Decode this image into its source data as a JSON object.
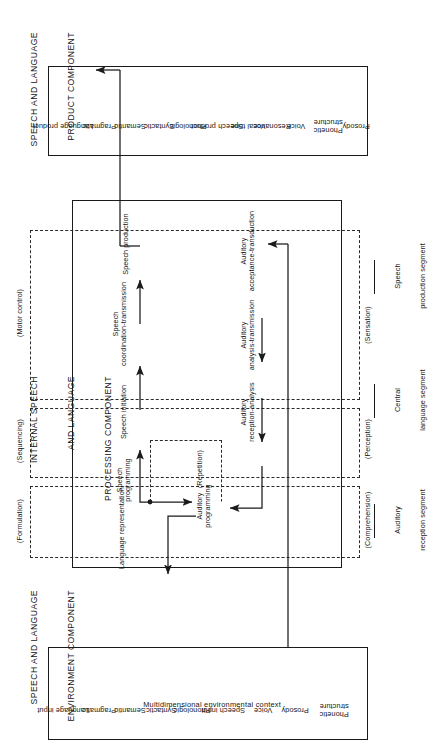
{
  "figure": {
    "orientation": "rotated-90-ccw",
    "ink_color": "#1a1a1a",
    "background": "#ffffff"
  },
  "sections": {
    "product": {
      "heading_line1": "SPEECH AND LANGUAGE",
      "heading_line2": "PRODUCT COMPONENT"
    },
    "internal": {
      "heading_line1": "INTERNAL SPEECH",
      "heading_line2": "AND LANGUAGE",
      "heading_line3": "PROCESSING COMPONENT"
    },
    "environment": {
      "heading_line1": "SPEECH AND LANGUAGE",
      "heading_line2": "ENVIRONMENT COMPONENT"
    }
  },
  "product_box": {
    "items": [
      "Language product",
      "Pragmatic",
      "Semantic",
      "Syntactic",
      "Phonologic",
      "Speech product",
      "Vocal tone",
      "Resonance",
      "Voice",
      "Phonetic\nstructure",
      "Prosody"
    ]
  },
  "environment_box": {
    "items": [
      "Language input",
      "Pragmatic",
      "Semantic",
      "Syntactic",
      "Phonologic",
      "Speech input",
      "Voice",
      "Prosody",
      "Phonetic\nstructure"
    ],
    "context_label": "Multidimensional environmental context"
  },
  "processing": {
    "stage_labels": [
      "(Comprehension)",
      "(Formulation)",
      "(Perception)",
      "(Sequencing)",
      "(Sensation)",
      "(Motor control)",
      "(Repetition)"
    ],
    "nodes": [
      "Language representation",
      "Auditory\nprogramming",
      "Speech\nprogramming",
      "Auditory\nreception-analysis",
      "Speech initiation",
      "Auditory\nanalysis-transmission",
      "Speech\ncoordination-transmission",
      "Auditory\nacceptance-transduction",
      "Speech production"
    ]
  },
  "segments": [
    {
      "line1": "Auditory",
      "line2": "reception segment"
    },
    {
      "line1": "Central",
      "line2": "language segment"
    },
    {
      "line1": "Speech",
      "line2": "production segment"
    }
  ]
}
